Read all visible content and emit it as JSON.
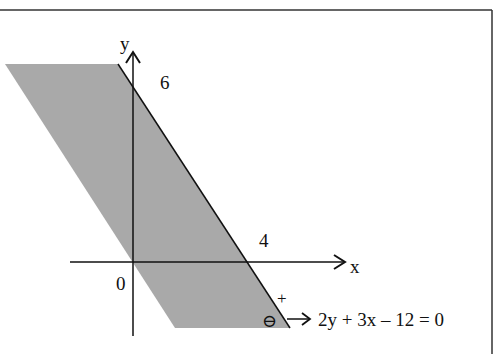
{
  "diagram": {
    "type": "linear-inequality-graph",
    "axes": {
      "x_label": "x",
      "y_label": "y",
      "origin_label": "0"
    },
    "intercepts": {
      "x_intercept_label": "4",
      "y_intercept_label": "6"
    },
    "boundary_line": {
      "equation": "2y + 3x – 12 = 0",
      "positive_side_label": "+",
      "negative_side_label": "⊖"
    },
    "shaded_region": {
      "description": "negative side of 2y + 3x – 12 = 0 (2y + 3x – 12 ≤ 0), bounded as a parallelogram strip",
      "fill_color": "#a9a9a9"
    },
    "colors": {
      "line": "#111111",
      "frame": "#333333",
      "background": "#ffffff"
    }
  }
}
